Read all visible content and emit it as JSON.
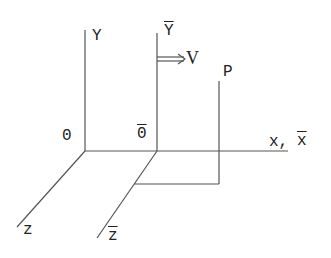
{
  "diagram": {
    "stroke_color": "#555555",
    "text_color": "#222222",
    "labels": {
      "y": "Y",
      "y_bar": "Y",
      "v": "V",
      "p": "P",
      "origin": "0",
      "origin_bar": "0",
      "x": "x,",
      "x_bar": "x",
      "z": "z",
      "z_bar": "z"
    },
    "overlined": [
      "y_bar",
      "origin_bar",
      "x_bar",
      "z_bar"
    ]
  }
}
